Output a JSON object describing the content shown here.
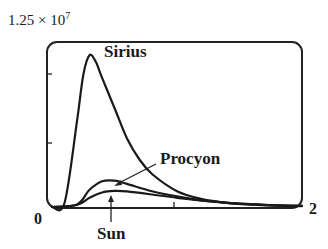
{
  "chart_data": {
    "type": "line",
    "title": "",
    "xlabel": "",
    "ylabel": "",
    "y_axis_max_label": "1.25 × 10^7",
    "x_tick_labels": [
      "0",
      "2"
    ],
    "xlim": [
      0,
      2
    ],
    "ylim": [
      0,
      12500000
    ],
    "grid": false,
    "legend_position": "inline annotations",
    "series": [
      {
        "name": "Sirius",
        "x": [
          0.0,
          0.1,
          0.2,
          0.25,
          0.3,
          0.35,
          0.4,
          0.5,
          0.6,
          0.7,
          0.8,
          1.0,
          1.2,
          1.4,
          1.6,
          1.8,
          2.0
        ],
        "values": [
          0,
          300000,
          6500000,
          10000000,
          11500000,
          11000000,
          9800000,
          7500000,
          5200000,
          3600000,
          2500000,
          1200000,
          600000,
          320000,
          180000,
          100000,
          60000
        ]
      },
      {
        "name": "Procyon",
        "x": [
          0.0,
          0.2,
          0.3,
          0.4,
          0.5,
          0.6,
          0.8,
          1.0,
          1.2,
          1.4,
          1.6,
          1.8,
          2.0
        ],
        "values": [
          0,
          200000,
          1300000,
          1950000,
          2000000,
          1750000,
          1200000,
          800000,
          500000,
          320000,
          200000,
          120000,
          80000
        ]
      },
      {
        "name": "Sun",
        "x": [
          0.0,
          0.2,
          0.3,
          0.4,
          0.5,
          0.6,
          0.8,
          1.0,
          1.2,
          1.4,
          1.6,
          1.8,
          2.0
        ],
        "values": [
          0,
          150000,
          700000,
          1100000,
          1220000,
          1180000,
          950000,
          700000,
          480000,
          320000,
          210000,
          130000,
          90000
        ]
      }
    ],
    "annotations": [
      "Sirius",
      "Procyon",
      "Sun"
    ]
  },
  "labels": {
    "ymax_base": "1.25 × 10",
    "ymax_exp": "7",
    "x_min": "0",
    "x_max": "2",
    "sirius": "Sirius",
    "procyon": "Procyon",
    "sun": "Sun"
  }
}
